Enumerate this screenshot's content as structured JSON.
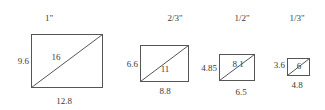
{
  "diagram": {
    "stroke_color": "#555555",
    "sizes": [
      {
        "scale_label": "1\"",
        "height_label": "9.6",
        "width_label": "12.8",
        "diagonal_label": "16",
        "rect": {
          "x": 31,
          "y": 34,
          "w": 71,
          "h": 53
        }
      },
      {
        "scale_label": "2/3\"",
        "height_label": "6.6",
        "width_label": "8.8",
        "diagonal_label": "11",
        "rect": {
          "x": 140,
          "y": 45,
          "w": 48,
          "h": 36
        }
      },
      {
        "scale_label": "1/2\"",
        "height_label": "4.85",
        "width_label": "6.5",
        "diagonal_label": "8.1",
        "rect": {
          "x": 219,
          "y": 54,
          "w": 35,
          "h": 26
        }
      },
      {
        "scale_label": "1/3\"",
        "height_label": "3.6",
        "width_label": "4.8",
        "diagonal_label": "6",
        "rect": {
          "x": 287,
          "y": 58,
          "w": 22,
          "h": 17
        }
      }
    ]
  }
}
